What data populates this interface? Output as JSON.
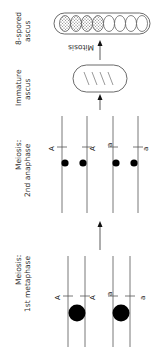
{
  "diagram": {
    "orientation": "rotated 90 degrees counter-clockwise",
    "stages": [
      {
        "id": "meiosis-1st-metaphase",
        "label_line1": "Meiosis:",
        "label_line2": "1st metaphase",
        "alleles": [
          "A",
          "A",
          "a",
          "a"
        ]
      },
      {
        "id": "meiosis-2nd-anaphase",
        "label_line1": "Meiosis:",
        "label_line2": "2nd anaphase",
        "alleles": [
          "A",
          "A",
          "a",
          "a"
        ]
      },
      {
        "id": "immature-ascus",
        "label_line1": "Immature",
        "label_line2": "ascus"
      },
      {
        "id": "eight-spored-ascus",
        "label_line1": "8-spored",
        "label_line2": "ascus",
        "spores_dark": 4,
        "spores_light": 4
      }
    ],
    "arrows": [
      {
        "from": "meiosis-1st-metaphase",
        "to": "meiosis-2nd-anaphase"
      },
      {
        "from": "meiosis-2nd-anaphase",
        "to": "immature-ascus"
      },
      {
        "from": "immature-ascus",
        "to": "eight-spored-ascus",
        "label": "Mitosis"
      }
    ],
    "colors": {
      "line": "#444444",
      "centromere": "#000000",
      "spore_dark_fill": "#bbbbbb"
    }
  }
}
